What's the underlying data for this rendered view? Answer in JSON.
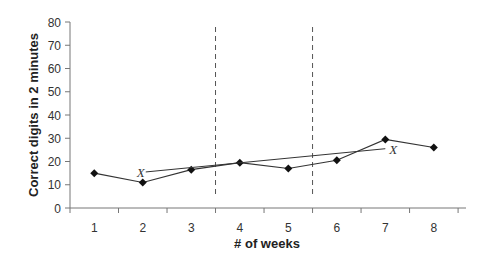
{
  "chart_data": {
    "type": "line",
    "title": "",
    "xlabel": "# of weeks",
    "ylabel": "Correct digits in 2 minutes",
    "ylim": [
      0,
      80
    ],
    "yticks": [
      0,
      10,
      20,
      30,
      40,
      50,
      60,
      70,
      80
    ],
    "categories": [
      "1",
      "2",
      "3",
      "4",
      "5",
      "6",
      "7",
      "8"
    ],
    "grid": false,
    "legend": null,
    "series": [
      {
        "name": "Correct digits",
        "marker": "diamond",
        "values": [
          15,
          11,
          16.5,
          19.5,
          17,
          20.5,
          29.5,
          26
        ]
      },
      {
        "name": "Trend line",
        "marker": "X",
        "points": [
          {
            "x": "2",
            "y": 15.5
          },
          {
            "x": "7",
            "y": 25.5
          }
        ]
      }
    ],
    "phase_lines": [
      {
        "between": [
          "3",
          "4"
        ],
        "style": "dashed"
      },
      {
        "between": [
          "5",
          "6"
        ],
        "style": "dashed"
      }
    ],
    "annotations": [
      "X",
      "X"
    ]
  }
}
